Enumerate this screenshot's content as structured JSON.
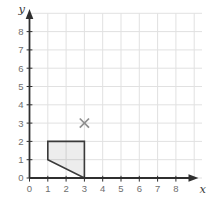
{
  "figure": {
    "background": "#ffffff"
  },
  "chart_data": {
    "type": "scatter",
    "title": "",
    "xlabel": "x",
    "ylabel": "y",
    "xlim": [
      0,
      9.4
    ],
    "ylim": [
      0,
      9
    ],
    "x_ticks": [
      0,
      1,
      2,
      3,
      4,
      5,
      6,
      7,
      8
    ],
    "y_ticks": [
      0,
      1,
      2,
      3,
      4,
      5,
      6,
      7,
      8
    ],
    "grid": true,
    "legend": false,
    "colors": {
      "axis": "#2f2f2f",
      "grid": "#e1e1e1",
      "tick_label": "#6e6e6e",
      "axis_letter": "#3a3a3a",
      "shape_stroke": "#3a3a3a",
      "shape_fill": "rgba(0,0,0,0.07)",
      "marker": "#8f8f8f"
    },
    "series": [
      {
        "name": "quadrilateral",
        "type": "polygon",
        "points": [
          [
            1,
            2
          ],
          [
            3,
            2
          ],
          [
            3,
            0
          ],
          [
            1,
            1
          ]
        ]
      },
      {
        "name": "cross-marker",
        "type": "cross",
        "x": 3,
        "y": 3
      }
    ]
  }
}
